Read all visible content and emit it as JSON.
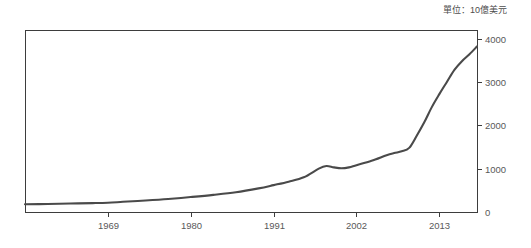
{
  "figure": {
    "unit_note": "單位：10億美元",
    "background_color": "#ffffff",
    "frame_color": "#3d3d3d",
    "line_color": "#4a4a4a",
    "text_color": "#595959"
  },
  "chart_data": {
    "type": "line",
    "title": "",
    "subtitle": "",
    "annotations": [
      "單位：10億美元"
    ],
    "xlabel": "",
    "ylabel": "",
    "unit": "10億美元",
    "grid": false,
    "legend": "none",
    "xlim": [
      1958,
      2018
    ],
    "ylim": [
      0,
      4200
    ],
    "xticks": [
      1969,
      1980,
      1991,
      2002,
      2013
    ],
    "xtick_labels": [
      "1969",
      "1980",
      "1991",
      "2002",
      "2013"
    ],
    "yticks": [
      0,
      1000,
      2000,
      3000,
      4000
    ],
    "ytick_labels": [
      "0",
      "1000",
      "2000",
      "3000",
      "4000"
    ],
    "series": [
      {
        "name": "value",
        "x": [
          1958,
          1961,
          1964,
          1967,
          1969,
          1971,
          1974,
          1977,
          1980,
          1983,
          1986,
          1989,
          1991,
          1993,
          1995,
          1997,
          1998,
          1999,
          2000,
          2001,
          2002,
          2004,
          2006,
          2007,
          2008,
          2009,
          2010,
          2011,
          2012,
          2013,
          2014,
          2015,
          2016,
          2017,
          2018
        ],
        "values": [
          180,
          185,
          195,
          205,
          215,
          235,
          265,
          300,
          345,
          395,
          455,
          545,
          620,
          700,
          800,
          1000,
          1060,
          1030,
          1010,
          1030,
          1080,
          1180,
          1310,
          1360,
          1400,
          1480,
          1760,
          2070,
          2420,
          2720,
          3000,
          3280,
          3480,
          3640,
          3820
        ]
      }
    ]
  },
  "plot_geometry": {
    "left": 25,
    "top": 30,
    "right": 477,
    "bottom": 212
  }
}
